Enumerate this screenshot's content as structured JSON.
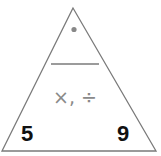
{
  "diagram": {
    "type": "fact-family-triangle",
    "top_value": "•",
    "operations": "×, ÷",
    "bottom_left": "5",
    "bottom_right": "9",
    "colors": {
      "outline": "#7a7a7a",
      "numbers": "#111111",
      "operations": "#8a8a8a",
      "dot": "#888888"
    }
  }
}
